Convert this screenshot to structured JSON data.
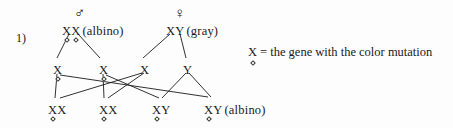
{
  "figure": {
    "item_number": "1)",
    "background_color": "#fdfdfd",
    "ink_color": "#1a1a1a"
  },
  "legend": {
    "allele_symbol": "X",
    "equals": "=",
    "text": "the gene with the color mutation",
    "full_text": "X = the gene with the color mutation"
  },
  "parents": [
    {
      "id": "father",
      "sex_symbol": "♂",
      "sex_name": "male-symbol",
      "genotype": "XX",
      "alleles": [
        {
          "letter": "X",
          "mutated": true
        },
        {
          "letter": "X",
          "mutated": true
        }
      ],
      "phenotype": "(albino)",
      "x": 62,
      "y": 25,
      "symbol_x": 74,
      "symbol_y": 6
    },
    {
      "id": "mother",
      "sex_symbol": "♀",
      "sex_name": "female-symbol",
      "genotype": "XY",
      "alleles": [
        {
          "letter": "X",
          "mutated": false
        },
        {
          "letter": "Y",
          "mutated": false
        }
      ],
      "phenotype": "(gray)",
      "x": 166,
      "y": 25,
      "symbol_x": 174,
      "symbol_y": 6
    }
  ],
  "gametes": [
    {
      "id": "gamete-1",
      "letter": "X",
      "mutated": true,
      "x": 53,
      "y": 64
    },
    {
      "id": "gamete-2",
      "letter": "X",
      "mutated": true,
      "x": 99,
      "y": 64
    },
    {
      "id": "gamete-3",
      "letter": "X",
      "mutated": false,
      "x": 140,
      "y": 64
    },
    {
      "id": "gamete-4",
      "letter": "Y",
      "mutated": false,
      "x": 183,
      "y": 64
    }
  ],
  "offspring": [
    {
      "id": "offspring-1",
      "genotype": "XX",
      "alleles": [
        {
          "letter": "X",
          "mutated": true
        },
        {
          "letter": "X",
          "mutated": false
        }
      ],
      "phenotype": "",
      "x": 48,
      "y": 104
    },
    {
      "id": "offspring-2",
      "genotype": "XX",
      "alleles": [
        {
          "letter": "X",
          "mutated": true
        },
        {
          "letter": "X",
          "mutated": false
        }
      ],
      "phenotype": "",
      "x": 99,
      "y": 104
    },
    {
      "id": "offspring-3",
      "genotype": "XY",
      "alleles": [
        {
          "letter": "X",
          "mutated": true
        },
        {
          "letter": "Y",
          "mutated": false
        }
      ],
      "phenotype": "",
      "x": 152,
      "y": 104
    },
    {
      "id": "offspring-4",
      "genotype": "XY",
      "alleles": [
        {
          "letter": "X",
          "mutated": true
        },
        {
          "letter": "Y",
          "mutated": false
        }
      ],
      "phenotype": "(albino)",
      "x": 204,
      "y": 104
    }
  ],
  "connections": [
    {
      "from": "father-allele-1",
      "to": "gamete-1",
      "x1": 69,
      "y1": 34,
      "x2": 57,
      "y2": 58
    },
    {
      "from": "father-allele-2",
      "to": "gamete-2",
      "x1": 78,
      "y1": 34,
      "x2": 100,
      "y2": 58
    },
    {
      "from": "mother-allele-x",
      "to": "gamete-3",
      "x1": 170,
      "y1": 34,
      "x2": 143,
      "y2": 58
    },
    {
      "from": "mother-allele-y",
      "to": "gamete-4",
      "x1": 180,
      "y1": 34,
      "x2": 186,
      "y2": 58
    },
    {
      "from": "gamete-1",
      "to": "offspring-1",
      "x1": 57,
      "y1": 74,
      "x2": 55,
      "y2": 98
    },
    {
      "from": "gamete-1",
      "to": "offspring-4",
      "x1": 60,
      "y1": 75,
      "x2": 208,
      "y2": 97
    },
    {
      "from": "gamete-2",
      "to": "offspring-2",
      "x1": 103,
      "y1": 74,
      "x2": 104,
      "y2": 98
    },
    {
      "from": "gamete-2",
      "to": "offspring-3",
      "x1": 106,
      "y1": 75,
      "x2": 159,
      "y2": 98
    },
    {
      "from": "gamete-3",
      "to": "offspring-1",
      "x1": 142,
      "y1": 73,
      "x2": 60,
      "y2": 98
    },
    {
      "from": "gamete-3",
      "to": "offspring-2",
      "x1": 144,
      "y1": 73,
      "x2": 108,
      "y2": 98
    },
    {
      "from": "gamete-4",
      "to": "offspring-3",
      "x1": 186,
      "y1": 73,
      "x2": 162,
      "y2": 98
    },
    {
      "from": "gamete-4",
      "to": "offspring-4",
      "x1": 189,
      "y1": 73,
      "x2": 211,
      "y2": 97
    }
  ]
}
